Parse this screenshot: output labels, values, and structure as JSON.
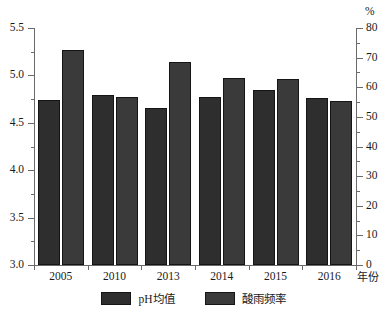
{
  "chart_data": {
    "type": "bar",
    "title": "",
    "subtitle": "",
    "categories": [
      "2005",
      "2010",
      "2013",
      "2014",
      "2015",
      "2016"
    ],
    "series": [
      {
        "name": "pH均值",
        "axis": "left",
        "color": "#2e2e2e",
        "values": [
          4.74,
          4.79,
          4.66,
          4.77,
          4.85,
          4.76
        ]
      },
      {
        "name": "酸雨频率",
        "axis": "right",
        "color": "#3a3a3a",
        "values": [
          72.5,
          56.8,
          68.5,
          63.2,
          62.8,
          55.5
        ]
      }
    ],
    "xlabel": "年份",
    "ylabel": "",
    "ylabel_right": "%",
    "ylim": [
      3.0,
      5.5
    ],
    "ylim_right": [
      0,
      80
    ],
    "yticks": [
      "3.0",
      "3.5",
      "4.0",
      "4.5",
      "5.0",
      "5.5"
    ],
    "yticks_right": [
      "0",
      "10",
      "20",
      "30",
      "40",
      "50",
      "60",
      "70",
      "80"
    ],
    "minor_ticks": true,
    "grid": false,
    "legend_position": "bottom"
  },
  "axes": {
    "left": {
      "unit": "",
      "ticks": [
        {
          "label": "5.0",
          "value": 5.0
        },
        {
          "label": "5.5",
          "value": 5.5
        },
        {
          "label": "4.5",
          "value": 4.5
        },
        {
          "label": "4.0",
          "value": 4.0
        },
        {
          "label": "3.5",
          "value": 3.5
        },
        {
          "label": "3.0",
          "value": 3.0
        }
      ]
    },
    "right": {
      "unit": "%",
      "ticks": [
        {
          "label": "80",
          "value": 80
        },
        {
          "label": "70",
          "value": 70
        },
        {
          "label": "60",
          "value": 60
        },
        {
          "label": "50",
          "value": 50
        },
        {
          "label": "40",
          "value": 40
        },
        {
          "label": "30",
          "value": 30
        },
        {
          "label": "20",
          "value": 20
        },
        {
          "label": "10",
          "value": 10
        },
        {
          "label": "0",
          "value": 0
        }
      ]
    },
    "bottom": {
      "unit": "年份",
      "categories": [
        "2005",
        "2010",
        "2013",
        "2014",
        "2015",
        "2016"
      ]
    }
  },
  "legend": {
    "items": [
      {
        "label": "pH均值",
        "color": "#2e2e2e"
      },
      {
        "label": "酸雨频率",
        "color": "#3a3a3a"
      }
    ]
  }
}
